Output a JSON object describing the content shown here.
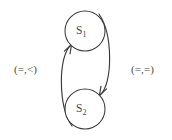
{
  "diagram": {
    "type": "state-transition-diagram",
    "background_color": "#ffffff",
    "stroke_color": "#3a3a3a",
    "text_color": "#4a4a4a",
    "nodes": [
      {
        "id": "s1",
        "label_base": "S",
        "label_sub": "1",
        "label_full": "S1",
        "cx": 85,
        "cy": 31,
        "r": 20
      },
      {
        "id": "s2",
        "label_base": "S",
        "label_sub": "2",
        "label_full": "S2",
        "cx": 85,
        "cy": 109,
        "r": 20
      }
    ],
    "edges": [
      {
        "id": "edge-s2-to-s1",
        "from": "s2",
        "to": "s1",
        "label": "(=,<)",
        "direction": "upward",
        "side": "left"
      },
      {
        "id": "edge-s1-to-s2",
        "from": "s1",
        "to": "s2",
        "label": "(=,=)",
        "direction": "downward",
        "side": "right"
      }
    ]
  }
}
